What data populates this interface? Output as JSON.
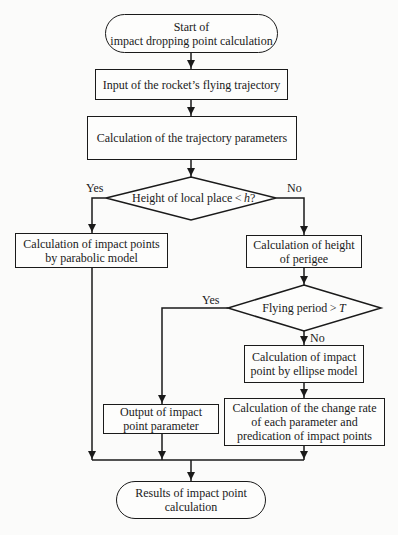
{
  "flowchart": {
    "colors": {
      "stroke": "#1a1a1a",
      "background": "#fbfbfa"
    },
    "nodes": {
      "start": {
        "type": "terminal",
        "text": "Start of\nimpact dropping point calculation"
      },
      "input": {
        "type": "process",
        "text": "Input of the rocket’s flying trajectory"
      },
      "params": {
        "type": "process",
        "text": "Calculation of the trajectory parameters"
      },
      "decision1": {
        "type": "decision",
        "text_prefix": "Height of local place < ",
        "text_var": "h",
        "text_suffix": "?"
      },
      "parabolic": {
        "type": "process",
        "text": "Calculation of impact points\nby parabolic model"
      },
      "perigee": {
        "type": "process",
        "text": "Calculation of height\nof perigee"
      },
      "decision2": {
        "type": "decision",
        "text_prefix": "Flying period > ",
        "text_var": "T",
        "text_suffix": ""
      },
      "ellipse": {
        "type": "process",
        "text": "Calculation of impact\npoint by ellipse model"
      },
      "output": {
        "type": "process",
        "text": "Output of impact\npoint parameter"
      },
      "change_rate": {
        "type": "process",
        "text": "Calculation of the change rate\nof each parameter and\npredication of impact points"
      },
      "results": {
        "type": "terminal",
        "text": "Results of impact point\ncalculation"
      }
    },
    "edge_labels": {
      "d1_yes": "Yes",
      "d1_no": "No",
      "d2_yes": "Yes",
      "d2_no": "No"
    },
    "edges": [
      {
        "from": "start",
        "to": "input"
      },
      {
        "from": "input",
        "to": "params"
      },
      {
        "from": "params",
        "to": "decision1"
      },
      {
        "from": "decision1",
        "to": "parabolic",
        "label": "Yes"
      },
      {
        "from": "decision1",
        "to": "perigee",
        "label": "No"
      },
      {
        "from": "perigee",
        "to": "decision2"
      },
      {
        "from": "decision2",
        "to": "output",
        "label": "Yes"
      },
      {
        "from": "decision2",
        "to": "ellipse",
        "label": "No"
      },
      {
        "from": "ellipse",
        "to": "change_rate"
      },
      {
        "from": "parabolic",
        "to": "results"
      },
      {
        "from": "output",
        "to": "results"
      },
      {
        "from": "change_rate",
        "to": "results"
      }
    ]
  }
}
